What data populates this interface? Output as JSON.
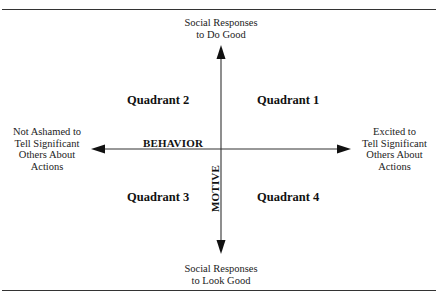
{
  "diagram": {
    "type": "quadrant-matrix",
    "axes": {
      "horizontal": {
        "name": "BEHAVIOR",
        "left_pole": "Not Ashamed to Tell Significant Others About Actions",
        "right_pole": "Excited to Tell Significant Others About Actions"
      },
      "vertical": {
        "name": "MOTIVE",
        "top_pole": "Social Responses to Do Good",
        "bottom_pole": "Social Responses to Look Good"
      }
    },
    "quadrants": [
      {
        "id": 1,
        "label": "Quadrant 1",
        "position": "top-right"
      },
      {
        "id": 2,
        "label": "Quadrant 2",
        "position": "top-left"
      },
      {
        "id": 3,
        "label": "Quadrant 3",
        "position": "bottom-left"
      },
      {
        "id": 4,
        "label": "Quadrant 4",
        "position": "bottom-right"
      }
    ]
  },
  "labels": {
    "top_line1": "Social Responses",
    "top_line2": "to Do Good",
    "bottom_line1": "Social Responses",
    "bottom_line2": "to Look Good",
    "left_line1": "Not Ashamed to",
    "left_line2": "Tell Significant",
    "left_line3": "Others About",
    "left_line4": "Actions",
    "right_line1": "Excited to",
    "right_line2": "Tell Significant",
    "right_line3": "Others About",
    "right_line4": "Actions",
    "behavior": "BEHAVIOR",
    "motive": "MOTIVE",
    "q1": "Quadrant 1",
    "q2": "Quadrant 2",
    "q3": "Quadrant 3",
    "q4": "Quadrant 4"
  },
  "colors": {
    "ink": "#1a1a1a",
    "background": "#ffffff"
  }
}
